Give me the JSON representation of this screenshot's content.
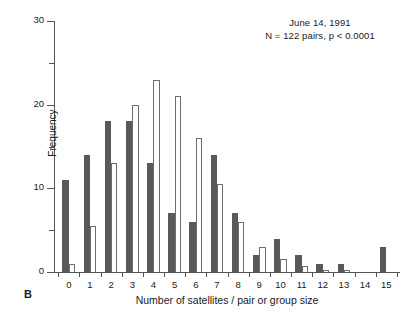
{
  "figure": {
    "panel_label": "B",
    "annotation_line1": "June 14, 1991",
    "annotation_line2": "N = 122 pairs, p < 0.0001"
  },
  "chart_data": {
    "type": "bar",
    "title": "",
    "subtitle": "June 14, 1991",
    "annotation": "N = 122 pairs, p < 0.0001",
    "xlabel": "Number of satellites / pair or group size",
    "ylabel": "Frequency",
    "categories": [
      "0",
      "1",
      "2",
      "3",
      "4",
      "5",
      "6",
      "7",
      "8",
      "9",
      "10",
      "11",
      "12",
      "13",
      "14",
      "15"
    ],
    "xlim": [
      -0.5,
      15.5
    ],
    "ylim": [
      0,
      30
    ],
    "yticks": [
      0,
      10,
      20,
      30
    ],
    "yticks_minor": [
      5,
      15,
      25
    ],
    "grid": false,
    "legend": "none",
    "series": [
      {
        "name": "observed",
        "color": "#595959",
        "style": "filled",
        "values": [
          11,
          14,
          18,
          18,
          13,
          7,
          6,
          14,
          7,
          2,
          4,
          2,
          1,
          1,
          0,
          3
        ]
      },
      {
        "name": "expected",
        "color": "#ffffff",
        "style": "open",
        "values": [
          1,
          5.5,
          13,
          20,
          23,
          21,
          16,
          10.5,
          6,
          3,
          1.5,
          0.7,
          0.3,
          0.2,
          0,
          0
        ]
      }
    ]
  }
}
